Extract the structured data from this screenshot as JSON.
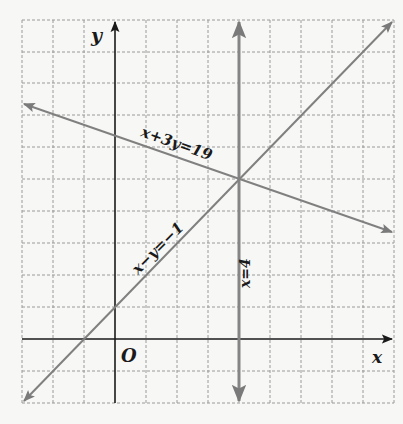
{
  "diagram": {
    "type": "coordinate-plane-linear-system",
    "axes": {
      "x_label": "x",
      "y_label": "y",
      "origin_label": "O"
    },
    "grid": {
      "columns": 12,
      "rows": 12,
      "x_range": [
        -3,
        9
      ],
      "y_range": [
        -2,
        10
      ],
      "style": "dashed"
    },
    "lines": [
      {
        "name": "line-x-plus-3y",
        "equation": "x+3y=19",
        "label": "x+3y=19",
        "color": "#808080"
      },
      {
        "name": "line-x-minus-y",
        "equation": "x−y=−1",
        "label": "x−y=−1",
        "color": "#808080"
      },
      {
        "name": "line-x-equals-4",
        "equation": "x=4",
        "label": "x=4",
        "color": "#858585"
      }
    ],
    "intersection": {
      "x": 4,
      "y": 5
    },
    "colors": {
      "background": "#f7f7f5",
      "grid": "#9a9a9a",
      "axis": "#1a1a1a",
      "lines": "#808080"
    }
  }
}
